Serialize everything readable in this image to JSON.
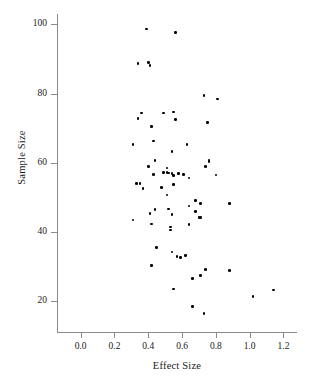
{
  "chart_data": {
    "type": "scatter",
    "title": "",
    "xlabel": "Effect Size",
    "ylabel": "Sample Size",
    "xlim": [
      -0.14,
      1.28
    ],
    "ylim": [
      11,
      103
    ],
    "grid": false,
    "legend": null,
    "marker_color": "#000000",
    "axis_color": "#8a8a8a",
    "xticks": [
      0.0,
      0.2,
      0.4,
      0.6,
      0.8,
      1.0,
      1.2
    ],
    "xtick_labels": [
      "0.0",
      "0.2",
      "0.4",
      "0.6",
      "0.8",
      "1.0",
      "1.2"
    ],
    "yticks": [
      20,
      40,
      60,
      80,
      100
    ],
    "ytick_labels": [
      "20",
      "40",
      "60",
      "80",
      "100"
    ],
    "points": [
      {
        "x": 0.39,
        "y": 98.7
      },
      {
        "x": 0.56,
        "y": 97.6
      },
      {
        "x": 0.34,
        "y": 88.7
      },
      {
        "x": 0.4,
        "y": 89.0
      },
      {
        "x": 0.41,
        "y": 88.1
      },
      {
        "x": 0.73,
        "y": 79.4
      },
      {
        "x": 0.81,
        "y": 78.4
      },
      {
        "x": 0.36,
        "y": 74.4
      },
      {
        "x": 0.49,
        "y": 74.4
      },
      {
        "x": 0.55,
        "y": 74.6
      },
      {
        "x": 0.34,
        "y": 72.7
      },
      {
        "x": 0.56,
        "y": 72.4
      },
      {
        "x": 0.75,
        "y": 71.6
      },
      {
        "x": 0.42,
        "y": 70.5
      },
      {
        "x": 0.43,
        "y": 66.2
      },
      {
        "x": 0.31,
        "y": 65.3
      },
      {
        "x": 0.63,
        "y": 65.3
      },
      {
        "x": 0.54,
        "y": 63.3
      },
      {
        "x": 0.76,
        "y": 60.3
      },
      {
        "x": 0.76,
        "y": 60.8
      },
      {
        "x": 0.44,
        "y": 60.6
      },
      {
        "x": 0.4,
        "y": 58.8
      },
      {
        "x": 0.74,
        "y": 58.9
      },
      {
        "x": 0.51,
        "y": 58.4
      },
      {
        "x": 0.49,
        "y": 57.1
      },
      {
        "x": 0.51,
        "y": 57.2
      },
      {
        "x": 0.52,
        "y": 57.0
      },
      {
        "x": 0.54,
        "y": 56.8
      },
      {
        "x": 0.43,
        "y": 56.6
      },
      {
        "x": 0.58,
        "y": 56.8
      },
      {
        "x": 0.61,
        "y": 56.6
      },
      {
        "x": 0.8,
        "y": 56.4
      },
      {
        "x": 0.55,
        "y": 56.2
      },
      {
        "x": 0.64,
        "y": 55.5
      },
      {
        "x": 0.33,
        "y": 54.0
      },
      {
        "x": 0.35,
        "y": 53.9
      },
      {
        "x": 0.55,
        "y": 53.7
      },
      {
        "x": 0.48,
        "y": 52.8
      },
      {
        "x": 0.37,
        "y": 52.6
      },
      {
        "x": 0.51,
        "y": 50.6
      },
      {
        "x": 0.68,
        "y": 49.1
      },
      {
        "x": 0.71,
        "y": 48.1
      },
      {
        "x": 0.88,
        "y": 48.2
      },
      {
        "x": 0.64,
        "y": 47.4
      },
      {
        "x": 0.44,
        "y": 46.4
      },
      {
        "x": 0.52,
        "y": 46.6
      },
      {
        "x": 0.68,
        "y": 45.9
      },
      {
        "x": 0.41,
        "y": 45.3
      },
      {
        "x": 0.54,
        "y": 45.0
      },
      {
        "x": 0.7,
        "y": 44.1
      },
      {
        "x": 0.71,
        "y": 44.2
      },
      {
        "x": 0.31,
        "y": 43.4
      },
      {
        "x": 0.42,
        "y": 42.3
      },
      {
        "x": 0.53,
        "y": 41.4
      },
      {
        "x": 0.64,
        "y": 42.1
      },
      {
        "x": 0.53,
        "y": 40.5
      },
      {
        "x": 0.45,
        "y": 35.4
      },
      {
        "x": 0.54,
        "y": 34.1
      },
      {
        "x": 0.57,
        "y": 32.9
      },
      {
        "x": 0.59,
        "y": 32.6
      },
      {
        "x": 0.62,
        "y": 33.2
      },
      {
        "x": 0.42,
        "y": 30.3
      },
      {
        "x": 0.74,
        "y": 29.1
      },
      {
        "x": 0.88,
        "y": 28.8
      },
      {
        "x": 0.66,
        "y": 26.5
      },
      {
        "x": 0.71,
        "y": 27.3
      },
      {
        "x": 0.55,
        "y": 23.4
      },
      {
        "x": 1.02,
        "y": 21.3
      },
      {
        "x": 1.14,
        "y": 23.2
      },
      {
        "x": 0.66,
        "y": 18.4
      },
      {
        "x": 0.73,
        "y": 16.3
      }
    ]
  }
}
